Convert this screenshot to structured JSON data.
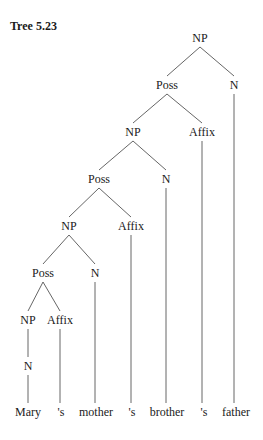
{
  "title": "Tree 5.23",
  "tree": {
    "nodes": [
      {
        "id": "np1",
        "label": "NP",
        "x": 200,
        "y": 42
      },
      {
        "id": "poss1",
        "label": "Poss",
        "x": 167,
        "y": 89
      },
      {
        "id": "n1",
        "label": "N",
        "x": 234,
        "y": 89
      },
      {
        "id": "np2",
        "label": "NP",
        "x": 133,
        "y": 136
      },
      {
        "id": "affix1",
        "label": "Affix",
        "x": 202,
        "y": 136
      },
      {
        "id": "poss2",
        "label": "Poss",
        "x": 99,
        "y": 183
      },
      {
        "id": "n2",
        "label": "N",
        "x": 166,
        "y": 183
      },
      {
        "id": "np3",
        "label": "NP",
        "x": 69,
        "y": 230
      },
      {
        "id": "affix2",
        "label": "Affix",
        "x": 131,
        "y": 230
      },
      {
        "id": "poss3",
        "label": "Poss",
        "x": 43,
        "y": 277
      },
      {
        "id": "n3",
        "label": "N",
        "x": 95,
        "y": 277
      },
      {
        "id": "np4",
        "label": "NP",
        "x": 28,
        "y": 324
      },
      {
        "id": "affix3",
        "label": "Affix",
        "x": 60,
        "y": 324
      },
      {
        "id": "n4",
        "label": "N",
        "x": 28,
        "y": 370
      }
    ],
    "words": [
      {
        "id": "w1",
        "label": "Mary",
        "x": 28,
        "y": 416
      },
      {
        "id": "w2",
        "label": "'s",
        "x": 61,
        "y": 416
      },
      {
        "id": "w3",
        "label": "mother",
        "x": 96,
        "y": 416
      },
      {
        "id": "w4",
        "label": "'s",
        "x": 132,
        "y": 416
      },
      {
        "id": "w5",
        "label": "brother",
        "x": 167,
        "y": 416
      },
      {
        "id": "w6",
        "label": "'s",
        "x": 204,
        "y": 416
      },
      {
        "id": "w7",
        "label": "father",
        "x": 236,
        "y": 416
      }
    ],
    "edges": [
      [
        "np1",
        "poss1"
      ],
      [
        "np1",
        "n1"
      ],
      [
        "poss1",
        "np2"
      ],
      [
        "poss1",
        "affix1"
      ],
      [
        "np2",
        "poss2"
      ],
      [
        "np2",
        "n2"
      ],
      [
        "poss2",
        "np3"
      ],
      [
        "poss2",
        "affix2"
      ],
      [
        "np3",
        "poss3"
      ],
      [
        "np3",
        "n3"
      ],
      [
        "poss3",
        "np4"
      ],
      [
        "poss3",
        "affix3"
      ],
      [
        "np4",
        "n4"
      ],
      [
        "n4",
        "w1"
      ],
      [
        "affix3",
        "w2"
      ],
      [
        "n3",
        "w3"
      ],
      [
        "affix2",
        "w4"
      ],
      [
        "n2",
        "w5"
      ],
      [
        "affix1",
        "w6"
      ],
      [
        "n1",
        "w7"
      ]
    ]
  }
}
